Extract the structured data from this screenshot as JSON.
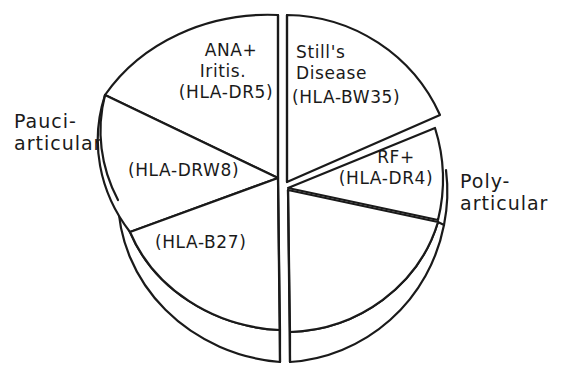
{
  "diagram": {
    "type": "exploded pie diagram (3D disk)",
    "groups": [
      {
        "id": "pauciarticular",
        "label_line1": "Pauci-",
        "label_line2": "articular",
        "side": "left",
        "segments": [
          {
            "id": "ana-iritis",
            "line1": "ANA+",
            "line2": "Iritis.",
            "line3": "(HLA-DR5)"
          },
          {
            "id": "hla-drw8",
            "line1": "(HLA-DRW8)"
          },
          {
            "id": "hla-b27",
            "line1": "(HLA-B27)"
          }
        ]
      },
      {
        "id": "polyarticular",
        "label_line1": "Poly-",
        "label_line2": "articular",
        "side": "right",
        "segments": [
          {
            "id": "stills-disease",
            "line1": "Still's",
            "line2": "Disease",
            "line3": "(HLA-BW35)"
          },
          {
            "id": "rf-positive",
            "line1": "RF+",
            "line2": "(HLA-DR4)"
          },
          {
            "id": "poly-unlabeled",
            "line1": ""
          }
        ]
      }
    ],
    "colors": {
      "line": "#1a1a1a",
      "background": "#ffffff"
    }
  }
}
